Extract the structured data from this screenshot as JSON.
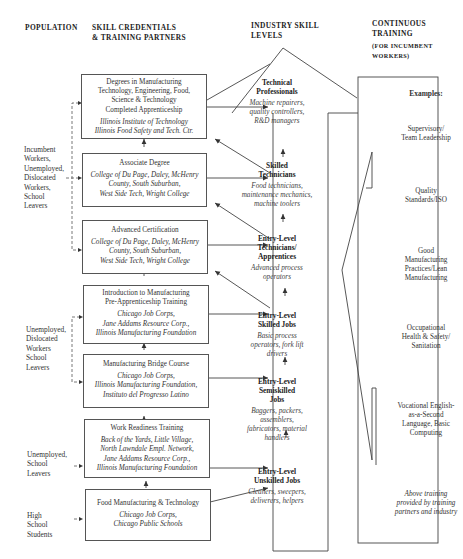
{
  "headers": {
    "population": "POPULATION",
    "credentials_line1": "SKILL CREDENTIALS",
    "credentials_line2": "& TRAINING PARTNERS",
    "industry_line1": "INDUSTRY SKILL",
    "industry_line2": "LEVELS",
    "continuous_line1": "CONTINUOUS",
    "continuous_line2": "TRAINING",
    "continuous_sub1": "(FOR INCUMBENT",
    "continuous_sub2": "WORKERS)"
  },
  "populations": [
    {
      "lines": [
        "Incumbent",
        "Workers,",
        "Unemployed,",
        "Dislocated",
        "Workers,",
        "School",
        "Leavers"
      ]
    },
    {
      "lines": [
        "Unemployed,",
        "Dislocated",
        "Workers",
        "School",
        "Leavers"
      ]
    },
    {
      "lines": [
        "Unemployed,",
        "School",
        "Leavers"
      ]
    },
    {
      "lines": [
        "High",
        "School",
        "Students"
      ]
    }
  ],
  "credentials": [
    {
      "title": [
        "Degrees in Manufacturing",
        "Technology, Engineering, Food,",
        "Science & Technology",
        "Completed Apprenticeship"
      ],
      "partners": [
        "Illinois Institute of Technology",
        "Illinois Food Safety and Tech. Ctr."
      ]
    },
    {
      "title": [
        "Associate Degree"
      ],
      "partners": [
        "College of Du Page, Daley, McHenry",
        "County, South Suburban,",
        "West Side Tech, Wright College"
      ]
    },
    {
      "title": [
        "Advanced Certification"
      ],
      "partners": [
        "College of Du Page, Daley, McHenry",
        "County, South Suburban,",
        "West Side Tech, Wright College"
      ]
    },
    {
      "title": [
        "Introduction to Manufacturing",
        "Pre-Apprenticeship Training"
      ],
      "partners": [
        "Chicago Job Corps,",
        "Jane Addams Resource Corp.,",
        "Illinois Manufacturing Foundation"
      ]
    },
    {
      "title": [
        "Manufacturing Bridge Course"
      ],
      "partners": [
        "Chicago Job Corps,",
        "Illinois Manufacturing Foundation,",
        "Instituto del Progresso Latino"
      ]
    },
    {
      "title": [
        "Work Readiness Training"
      ],
      "partners": [
        "Back of the Yards, Little Village,",
        "North Lawndale Empl. Network,",
        "Jane Addams Resource Corp.,",
        "Illinois Manufacturing Foundation"
      ]
    },
    {
      "title": [
        "Food Manufacturing & Technology"
      ],
      "partners": [
        "Chicago Job Corps,",
        "Chicago Public Schools"
      ]
    }
  ],
  "skill_levels": [
    {
      "title": [
        "Technical",
        "Professionals"
      ],
      "desc": [
        "Machine repairers,",
        "quality controllers,",
        "R&D managers"
      ]
    },
    {
      "title": [
        "Skilled",
        "Technicians"
      ],
      "desc": [
        "Food technicians,",
        "maintenance mechanics,",
        "machine toolers"
      ]
    },
    {
      "title": [
        "Entry-Level",
        "Technicians/",
        "Apprentices"
      ],
      "desc": [
        "Advanced process",
        "operators"
      ]
    },
    {
      "title": [
        "Entry-Level",
        "Skilled Jobs"
      ],
      "desc": [
        "Basic process",
        "operators, fork lift",
        "drivers"
      ]
    },
    {
      "title": [
        "Entry-Level",
        "Semiskilled",
        "Jobs"
      ],
      "desc": [
        "Baggers, packers,",
        "assemblers,",
        "fabricators, material",
        "handlers"
      ]
    },
    {
      "title": [
        "Entry-Level",
        "Unskilled Jobs"
      ],
      "desc": [
        "Cleaners, sweepers,",
        "deliverers, helpers"
      ]
    }
  ],
  "continuous_training": {
    "heading": "Examples:",
    "items": [
      [
        "Supervisory/",
        "Team Leadership"
      ],
      [
        "Quality",
        "Standards/ISO"
      ],
      [
        "Good",
        "Manufacturing",
        "Practices/Lean",
        "Manufacturing"
      ],
      [
        "Occupational",
        "Health & Safety/",
        "Sanitation"
      ],
      [
        "Vocational English-",
        "as-a-Second",
        "Language, Basic",
        "Computing"
      ]
    ],
    "footnote": [
      "Above training",
      "provided by training",
      "partners and industry"
    ]
  }
}
